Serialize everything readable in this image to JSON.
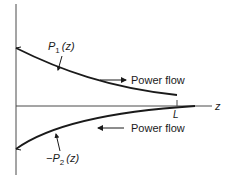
{
  "diagram": {
    "axis": {
      "horizontal_label": "z",
      "tick_label": "L"
    },
    "curves": [
      {
        "id": "P1",
        "label_prefix": "",
        "label_symbol": "P",
        "label_subscript": "1",
        "label_arg": "(z)",
        "direction": "forward",
        "flow_label": "Power flow",
        "flow_arrow": "right"
      },
      {
        "id": "P2",
        "label_prefix": "−",
        "label_symbol": "P",
        "label_subscript": "2",
        "label_arg": "(z)",
        "direction": "backward",
        "flow_label": "Power flow",
        "flow_arrow": "left"
      }
    ],
    "colors": {
      "line": "#1a1a1a",
      "axis": "#4a4a4a"
    }
  }
}
